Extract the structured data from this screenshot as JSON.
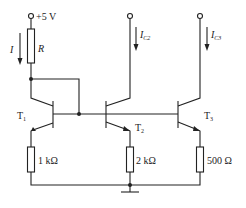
{
  "diagram": {
    "type": "current-mirror-circuit",
    "supply": {
      "label": "+5 V"
    },
    "reference_current": {
      "label": "I"
    },
    "reference_resistor": {
      "label": "R"
    },
    "transistors": [
      {
        "id": "T1",
        "label": "T",
        "sub": "1"
      },
      {
        "id": "T2",
        "label": "T",
        "sub": "2"
      },
      {
        "id": "T3",
        "label": "T",
        "sub": "3"
      }
    ],
    "collector_currents": [
      {
        "label": "I",
        "sub": "C2"
      },
      {
        "label": "I",
        "sub": "C3"
      }
    ],
    "emitter_resistors": [
      {
        "label": "1 kΩ"
      },
      {
        "label": "2 kΩ"
      },
      {
        "label": "500 Ω"
      }
    ],
    "ground": {
      "symbol": "ground"
    }
  }
}
